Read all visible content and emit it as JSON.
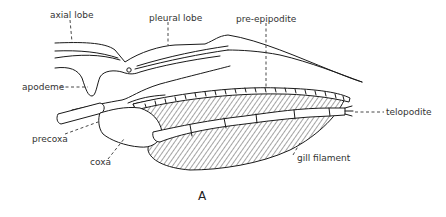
{
  "figure": {
    "panel_label": "A",
    "labels": {
      "axial_lobe": "axial lobe",
      "pleural_lobe": "pleural lobe",
      "pre_epipodite": "pre-epipodite",
      "apodeme": "apodeme",
      "telopodite": "telopodite",
      "precoxa": "precoxa",
      "coxa": "coxa",
      "gill_filament": "gill filament"
    },
    "colors": {
      "line": "#1a1a1a",
      "text": "#333333",
      "background": "#ffffff"
    }
  }
}
